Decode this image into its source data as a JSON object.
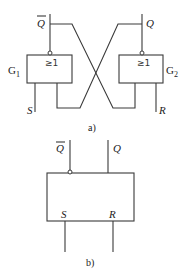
{
  "diagram_a": {
    "caption": "a)",
    "gate1": {
      "label": "G",
      "sub": "1",
      "symbol": "≥1"
    },
    "gate2": {
      "label": "G",
      "sub": "2",
      "symbol": "≥1"
    },
    "outputs": {
      "q_bar": "Q",
      "q": "Q"
    },
    "inputs": {
      "s": "S",
      "r": "R"
    }
  },
  "diagram_b": {
    "caption": "b)",
    "outputs": {
      "q_bar": "Q",
      "q": "Q"
    },
    "inputs": {
      "s": "S",
      "r": "R"
    },
    "pin_labels": {
      "s": "S",
      "r": "R"
    }
  }
}
